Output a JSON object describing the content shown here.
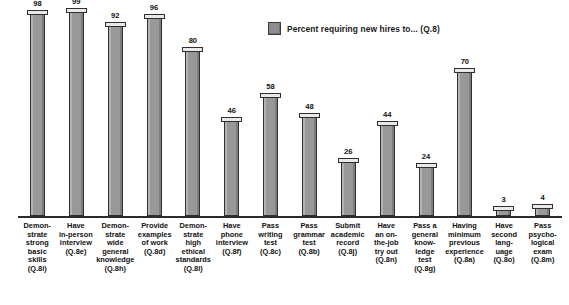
{
  "legend": {
    "swatch_color": "#8d8d8d",
    "label": "Percent requiring new hires to... (Q.8)"
  },
  "chart_data": {
    "type": "bar",
    "title": "",
    "xlabel": "",
    "ylabel": "",
    "ylim": [
      0,
      100
    ],
    "grid": false,
    "legend_position": "top-center",
    "legend_entries": [
      "Percent requiring new hires to... (Q.8)"
    ],
    "bar_color": "#989898",
    "categories": [
      "Demonstrate strong basic skills (Q.8i)",
      "Have in-person interview (Q.8e)",
      "Demonstrate wide general knowledge (Q.8h)",
      "Provide examples of work (Q.8d)",
      "Demonstrate high ethical standards (Q.8l)",
      "Have phone interview (Q.8f)",
      "Pass writing test (Q.8c)",
      "Pass grammar test (Q.8b)",
      "Submit academic record (Q.8j)",
      "Have an on-the-job try out (Q.8n)",
      "Pass a general knowledge test (Q.8g)",
      "Having minimum previous experience (Q.8a)",
      "Have second language (Q.8o)",
      "Pass psychological exam (Q.8m)"
    ],
    "values": [
      98,
      99,
      92,
      96,
      80,
      46,
      58,
      48,
      26,
      44,
      24,
      70,
      3,
      4
    ],
    "tick_labels_wrapped": [
      [
        "Demon-",
        "strate",
        "strong",
        "basic",
        "skills",
        "(Q.8i)"
      ],
      [
        "Have",
        "in-person",
        "interview",
        "(Q.8e)"
      ],
      [
        "Demon-",
        "strate",
        "wide",
        "general",
        "knowledge",
        "(Q.8h)"
      ],
      [
        "Provide",
        "examples",
        "of work",
        "(Q.8d)"
      ],
      [
        "Demon-",
        "strate",
        "high",
        "ethical",
        "standards",
        "(Q.8l)"
      ],
      [
        "Have",
        "phone",
        "interview",
        "(Q.8f)"
      ],
      [
        "Pass",
        "writing",
        "test",
        "(Q.8c)"
      ],
      [
        "Pass",
        "grammar",
        "test",
        "(Q.8b)"
      ],
      [
        "Submit",
        "academic",
        "record",
        "(Q.8j)"
      ],
      [
        "Have",
        "an on-",
        "the-job",
        "try out",
        "(Q.8n)"
      ],
      [
        "Pass a",
        "general",
        "know-",
        "ledge",
        "test",
        "(Q.8g)"
      ],
      [
        "Having",
        "minimum",
        "previous",
        "experience",
        "(Q.8a)"
      ],
      [
        "Have",
        "second",
        "lang-",
        "uage",
        "(Q.8o)"
      ],
      [
        "Pass",
        "psycho-",
        "logical",
        "exam",
        "(Q.8m)"
      ]
    ]
  }
}
